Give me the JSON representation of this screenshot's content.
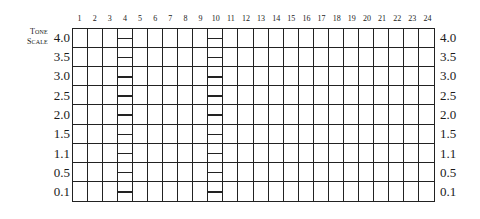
{
  "title": "Tone Scale",
  "title_lines": [
    "Tone",
    "Scale"
  ],
  "columns": [
    "1",
    "2",
    "3",
    "4",
    "5",
    "6",
    "7",
    "8",
    "9",
    "10",
    "11",
    "12",
    "13",
    "14",
    "15",
    "16",
    "17",
    "18",
    "19",
    "20",
    "21",
    "22",
    "23",
    "24"
  ],
  "rows": [
    "4.0",
    "3.5",
    "3.0",
    "2.5",
    "2.0",
    "1.5",
    "1.1",
    "0.5",
    "0.1"
  ],
  "ladder_columns": [
    4,
    10
  ],
  "colors": {
    "line": "#222222",
    "background": "#ffffff",
    "text": "#1a1a1a"
  }
}
